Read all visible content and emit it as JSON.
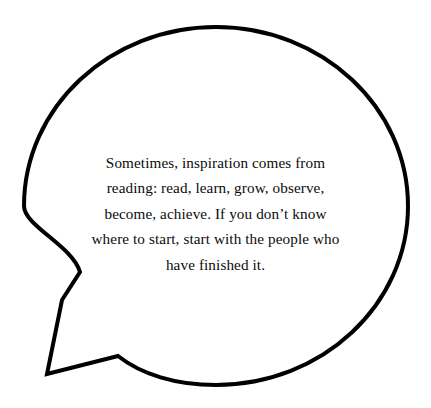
{
  "image": {
    "kind": "speech-bubble-quote-graphic",
    "width": 431,
    "height": 408,
    "background_color": "#FFFFFF"
  },
  "bubble": {
    "name": "speech-bubble",
    "shape": "ellipse-with-angular-tail",
    "outline_color": "#000000",
    "fill_color": "#FFFFFF",
    "stroke_width_px": 4,
    "ellipse": {
      "center_x": 216,
      "center_y": 206,
      "radius_x": 192,
      "radius_y": 179
    },
    "tail": {
      "name": "bubble-tail",
      "direction": "down-left",
      "points": [
        {
          "x": 80,
          "y": 272
        },
        {
          "x": 62,
          "y": 300
        },
        {
          "x": 47,
          "y": 374
        },
        {
          "x": 118,
          "y": 356
        }
      ]
    }
  },
  "quote": {
    "name": "quote-text",
    "text_color": "#0B0B0B",
    "alignment": "center",
    "full_text": "Sometimes, inspiration comes from reading: read, learn, grow, observe, become, achieve. If you don’t know where to start, start with the people who have finished it.",
    "lines": [
      "Sometimes, inspiration comes from",
      "reading: read, learn, grow, observe,",
      "become, achieve. If you don’t know",
      "where to start, start with the people who",
      "have finished it."
    ]
  }
}
